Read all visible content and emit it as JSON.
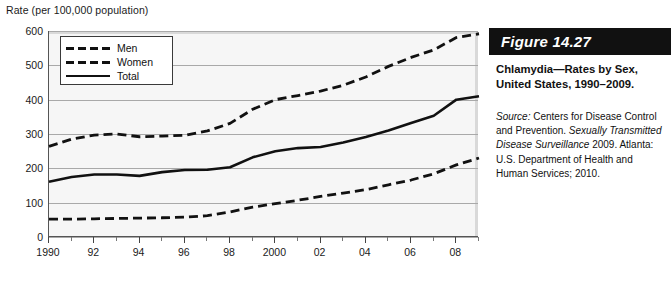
{
  "chart_data": {
    "type": "line",
    "title": "",
    "ylabel": "Rate (per 100,000 population)",
    "xlabel": "",
    "ylim": [
      0,
      600
    ],
    "ytick_labels": [
      "0",
      "100",
      "200",
      "300",
      "400",
      "500",
      "600"
    ],
    "yticks": [
      0,
      100,
      200,
      300,
      400,
      500,
      600
    ],
    "grid": "horizontal",
    "legend_position": "upper-left-inside",
    "x": [
      1990,
      1991,
      1992,
      1993,
      1994,
      1995,
      1996,
      1997,
      1998,
      1999,
      2000,
      2001,
      2002,
      2003,
      2004,
      2005,
      2006,
      2007,
      2008,
      2009
    ],
    "xtick_labels": [
      "1990",
      "92",
      "94",
      "96",
      "98",
      "2000",
      "02",
      "04",
      "06",
      "08"
    ],
    "xticks": [
      1990,
      1992,
      1994,
      1996,
      1998,
      2000,
      2002,
      2004,
      2006,
      2008
    ],
    "xlim": [
      1990,
      2009
    ],
    "series": [
      {
        "name": "Men",
        "style": "dashed",
        "color": "#111111",
        "values": [
          52,
          52,
          53,
          54,
          55,
          56,
          58,
          62,
          73,
          87,
          97,
          107,
          118,
          128,
          138,
          152,
          166,
          184,
          210,
          230
        ]
      },
      {
        "name": "Women",
        "style": "dashed",
        "color": "#111111",
        "values": [
          264,
          285,
          297,
          300,
          292,
          294,
          296,
          309,
          331,
          372,
          400,
          412,
          425,
          442,
          466,
          497,
          523,
          545,
          581,
          592
        ]
      },
      {
        "name": "Total",
        "style": "solid",
        "color": "#111111",
        "values": [
          161,
          175,
          182,
          182,
          178,
          189,
          195,
          196,
          203,
          232,
          250,
          259,
          262,
          275,
          291,
          310,
          332,
          353,
          400,
          410
        ]
      }
    ]
  },
  "figure": {
    "number_label": "Figure 14.27",
    "caption_title": "Chlamydia—Rates by Sex, United States, 1990–2009.",
    "source_label": "Source:",
    "source_text_1": " Centers for Disease Control and Prevention. ",
    "source_italic": "Sexually Transmitted Disease Surveillance",
    "source_text_2": " 2009. Atlanta: U.S. Department of Health and Human Services; 2010."
  },
  "legend": {
    "items": [
      {
        "label": "Men"
      },
      {
        "label": "Women"
      },
      {
        "label": "Total"
      }
    ]
  }
}
